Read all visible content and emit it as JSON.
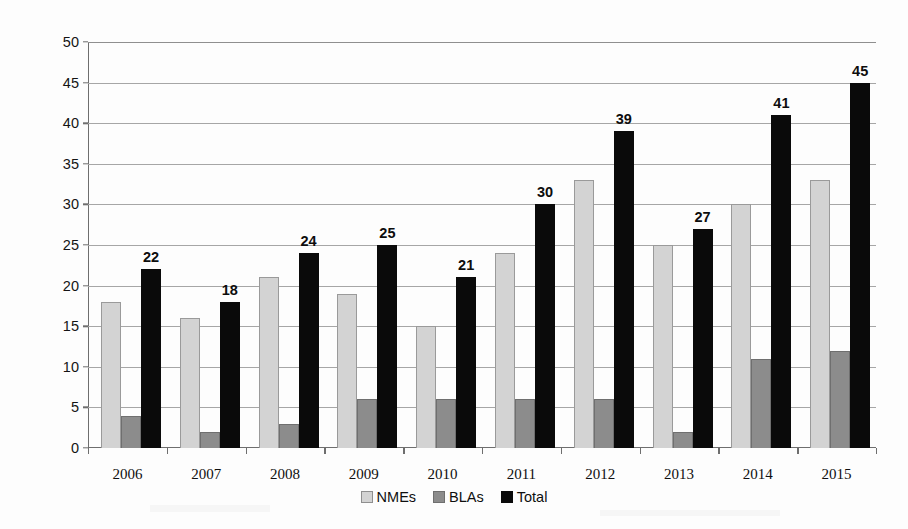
{
  "chart_data": {
    "type": "bar",
    "title": "",
    "xlabel": "",
    "ylabel": "FDA approved new drugs",
    "ylim": [
      0,
      50
    ],
    "ytick_step": 5,
    "yticks": [
      0,
      5,
      10,
      15,
      20,
      25,
      30,
      35,
      40,
      45,
      50
    ],
    "grid": true,
    "legend_position": "bottom",
    "categories": [
      "2006",
      "2007",
      "2008",
      "2009",
      "2010",
      "2011",
      "2012",
      "2013",
      "2014",
      "2015"
    ],
    "series": [
      {
        "name": "NMEs",
        "color": "#d3d3d3",
        "values": [
          18,
          16,
          21,
          19,
          15,
          24,
          33,
          25,
          30,
          33
        ]
      },
      {
        "name": "BLAs",
        "color": "#8c8c8c",
        "values": [
          4,
          2,
          3,
          6,
          6,
          6,
          6,
          2,
          11,
          12
        ]
      },
      {
        "name": "Total",
        "color": "#0a0a0a",
        "values": [
          22,
          18,
          24,
          25,
          21,
          30,
          39,
          27,
          41,
          45
        ]
      }
    ],
    "data_labels": {
      "series": "Total",
      "values": [
        "22",
        "18",
        "24",
        "25",
        "21",
        "30",
        "39",
        "27",
        "41",
        "45"
      ]
    }
  },
  "axes": {
    "y_title": "FDA approved new drugs",
    "y_tick_labels": [
      "50",
      "45",
      "40",
      "35",
      "30",
      "25",
      "20",
      "15",
      "10",
      "5",
      "0"
    ],
    "x_tick_labels": [
      "2006",
      "2007",
      "2008",
      "2009",
      "2010",
      "2011",
      "2012",
      "2013",
      "2014",
      "2015"
    ]
  },
  "legend": {
    "items": [
      {
        "label": "NMEs",
        "swatch": "light-gray"
      },
      {
        "label": "BLAs",
        "swatch": "medium-gray"
      },
      {
        "label": "Total",
        "swatch": "black"
      }
    ]
  },
  "colors": {
    "nme": "#d3d3d3",
    "bla": "#8c8c8c",
    "total": "#0a0a0a",
    "gridline": "#a6a6a6",
    "axis": "#6e6e6e",
    "text": "#0f0f0f",
    "background": "#ffffff"
  }
}
